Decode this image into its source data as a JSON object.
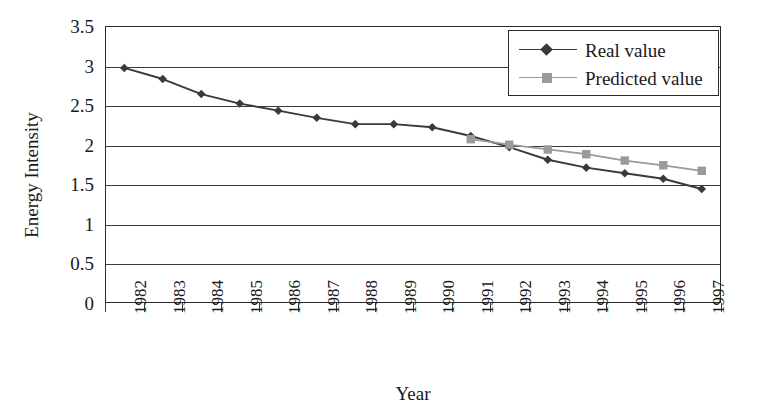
{
  "chart_data": {
    "type": "line",
    "title": "",
    "xlabel": "Year",
    "ylabel": "Energy Intensity",
    "categories": [
      "1982",
      "1983",
      "1984",
      "1985",
      "1986",
      "1987",
      "1988",
      "1989",
      "1990",
      "1991",
      "1992",
      "1993",
      "1994",
      "1995",
      "1996",
      "1997"
    ],
    "yticks": [
      "0",
      "0.5",
      "1",
      "1.5",
      "2",
      "2.5",
      "3",
      "3.5"
    ],
    "ytick_values": [
      0,
      0.5,
      1,
      1.5,
      2,
      2.5,
      3,
      3.5
    ],
    "ylim": [
      0,
      3.5
    ],
    "grid": true,
    "legend_position": "top-right",
    "series": [
      {
        "name": "Real value",
        "marker": "diamond",
        "color": "#3a3a3a",
        "x": [
          "1982",
          "1983",
          "1984",
          "1985",
          "1986",
          "1987",
          "1988",
          "1989",
          "1990",
          "1991",
          "1992",
          "1993",
          "1994",
          "1995",
          "1996",
          "1997"
        ],
        "values": [
          2.97,
          2.83,
          2.64,
          2.52,
          2.43,
          2.34,
          2.26,
          2.26,
          2.22,
          2.11,
          1.97,
          1.81,
          1.71,
          1.64,
          1.57,
          1.44
        ]
      },
      {
        "name": "Predicted value",
        "marker": "square",
        "color": "#9a9a9a",
        "x": [
          "1991",
          "1992",
          "1993",
          "1994",
          "1995",
          "1996",
          "1997"
        ],
        "values": [
          2.07,
          2.0,
          1.94,
          1.88,
          1.8,
          1.74,
          1.67
        ]
      }
    ]
  },
  "legend": {
    "items": [
      {
        "label": "Real value"
      },
      {
        "label": "Predicted value"
      }
    ]
  },
  "axes": {
    "x_title": "Year",
    "y_title": "Energy Intensity"
  },
  "colors": {
    "real": "#3a3a3a",
    "predicted": "#9a9a9a",
    "axis": "#2b2b2b",
    "grid": "#3a3a3a",
    "background": "#ffffff"
  }
}
